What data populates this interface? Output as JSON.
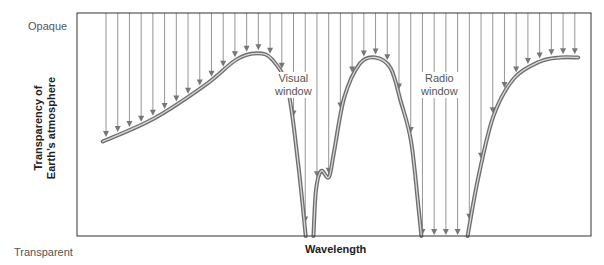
{
  "chart_data": {
    "type": "line",
    "title": "",
    "xlabel": "Wavelength",
    "ylabel": "Transparency of Earth's atmosphere",
    "ytick_labels": {
      "top": "Opaque",
      "bottom": "Transparent"
    },
    "grid": false,
    "annotations": [
      {
        "text": "Visual window",
        "region": "visual"
      },
      {
        "text": "Radio window",
        "region": "radio"
      }
    ],
    "x_range": [
      0,
      1
    ],
    "y_range": [
      0,
      1
    ],
    "curve_segments": [
      {
        "name": "short-wavelength-absorption",
        "points": [
          [
            0.05,
            0.45
          ],
          [
            0.15,
            0.56
          ],
          [
            0.25,
            0.72
          ],
          [
            0.31,
            0.84
          ],
          [
            0.35,
            0.87
          ],
          [
            0.38,
            0.84
          ],
          [
            0.41,
            0.7
          ],
          [
            0.43,
            0.35
          ],
          [
            0.445,
            0.0
          ]
        ]
      },
      {
        "name": "visual-to-infrared-absorption",
        "points": [
          [
            0.46,
            0.0
          ],
          [
            0.465,
            0.22
          ],
          [
            0.475,
            0.31
          ],
          [
            0.49,
            0.28
          ],
          [
            0.5,
            0.4
          ],
          [
            0.52,
            0.66
          ],
          [
            0.55,
            0.82
          ],
          [
            0.58,
            0.85
          ],
          [
            0.61,
            0.8
          ],
          [
            0.63,
            0.64
          ],
          [
            0.65,
            0.45
          ],
          [
            0.665,
            0.12
          ],
          [
            0.67,
            0.0
          ]
        ]
      },
      {
        "name": "long-wavelength-absorption",
        "points": [
          [
            0.76,
            0.0
          ],
          [
            0.78,
            0.27
          ],
          [
            0.81,
            0.57
          ],
          [
            0.85,
            0.75
          ],
          [
            0.9,
            0.83
          ],
          [
            0.94,
            0.85
          ],
          [
            0.975,
            0.85
          ]
        ]
      }
    ],
    "arrow_count": 42
  },
  "colors": {
    "frame": "#333333",
    "arrow": "#8a8a8a",
    "curve_outer": "#6e6e6e",
    "curve_inner": "#d8d8d8"
  },
  "labels": {
    "opaque": "Opaque",
    "transparent": "Transparent",
    "xaxis": "Wavelength",
    "yaxis_line1": "Transparency of",
    "yaxis_line2": "Earth’s atmosphere",
    "visual_line1": "Visual",
    "visual_line2": "window",
    "radio_line1": "Radio",
    "radio_line2": "window"
  }
}
